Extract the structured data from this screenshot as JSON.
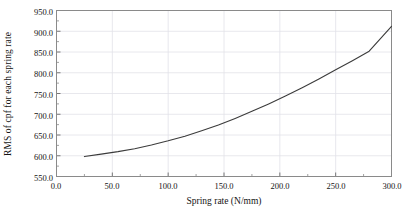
{
  "chart_data": {
    "type": "line",
    "title": "",
    "xlabel": "Spring rate (N/mm)",
    "ylabel": "RMS of cpf for each spring rate",
    "xlim": [
      0.0,
      300.0
    ],
    "ylim": [
      550.0,
      950.0
    ],
    "xticks": [
      "0.0",
      "50.0",
      "100.0",
      "150.0",
      "200.0",
      "250.0",
      "300.0"
    ],
    "xtick_values": [
      0.0,
      50.0,
      100.0,
      150.0,
      200.0,
      250.0,
      300.0
    ],
    "yticks": [
      "550.0",
      "600.0",
      "650.0",
      "700.0",
      "750.0",
      "800.0",
      "850.0",
      "900.0",
      "950.0"
    ],
    "ytick_values": [
      550.0,
      600.0,
      650.0,
      700.0,
      750.0,
      800.0,
      850.0,
      900.0,
      950.0
    ],
    "grid": true,
    "legend": "none",
    "line_color": "#3b3b3b",
    "grid_color": "#e2e2e8",
    "frame_color": "#8a8a8a",
    "series": [
      {
        "name": "RMS of cpf",
        "x": [
          25,
          40,
          55,
          70,
          85,
          100,
          115,
          130,
          145,
          160,
          175,
          190,
          205,
          220,
          235,
          250,
          265,
          280,
          300
        ],
        "y": [
          598,
          604,
          610,
          617,
          626,
          636,
          647,
          660,
          674,
          690,
          707,
          725,
          744,
          764,
          785,
          807,
          829,
          852,
          912
        ]
      }
    ]
  }
}
